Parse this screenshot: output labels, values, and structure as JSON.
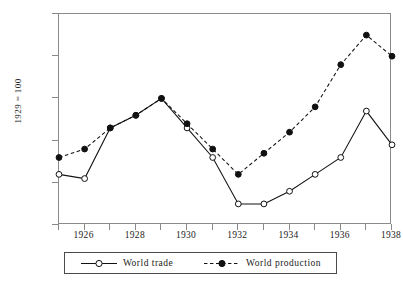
{
  "chart_data": {
    "type": "line",
    "title": "",
    "subtitle": "",
    "xlabel": "",
    "ylabel": "1929 = 100",
    "x": [
      1925,
      1926,
      1927,
      1928,
      1929,
      1930,
      1931,
      1932,
      1933,
      1934,
      1935,
      1936,
      1937,
      1938
    ],
    "xlim": [
      1925,
      1938
    ],
    "ylim": [
      70,
      120
    ],
    "yticks": [
      70,
      80,
      90,
      100,
      110,
      120
    ],
    "xticks": [
      1926,
      1928,
      1930,
      1932,
      1934,
      1936,
      1938
    ],
    "xtick_labels": [
      "1926",
      "1928",
      "1930",
      "1932",
      "1934",
      "1936",
      "1938"
    ],
    "ytick_labels": [
      "70",
      "80",
      "90",
      "100",
      "110",
      "120"
    ],
    "grid": false,
    "legend_position": "bottom",
    "series": [
      {
        "name": "World  trade",
        "values": [
          82,
          81,
          93,
          96,
          100,
          93,
          86,
          75,
          75,
          78,
          82,
          86,
          97,
          89
        ],
        "line_style": "solid",
        "marker": "open-circle",
        "color": "#111111"
      },
      {
        "name": "World production",
        "values": [
          86,
          88,
          93,
          96,
          100,
          94,
          88,
          82,
          87,
          92,
          98,
          108,
          115,
          110
        ],
        "line_style": "dashed",
        "marker": "filled-circle",
        "color": "#111111"
      }
    ]
  },
  "axes": {
    "y_title": "1929 = 100",
    "frame_color": "#8a8a8a"
  },
  "legend": {
    "entries": [
      {
        "label": "World  trade",
        "style": "solid-open-circle"
      },
      {
        "label": "World production",
        "style": "dashed-filled-circle"
      }
    ]
  }
}
